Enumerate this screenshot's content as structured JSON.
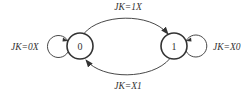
{
  "diagram": {
    "type": "state-diagram",
    "states": [
      {
        "id": "0",
        "label": "0"
      },
      {
        "id": "1",
        "label": "1"
      }
    ],
    "transitions": [
      {
        "from": "0",
        "to": "0",
        "label": "JK=0X"
      },
      {
        "from": "0",
        "to": "1",
        "label": "JK=1X"
      },
      {
        "from": "1",
        "to": "1",
        "label": "JK=X0"
      },
      {
        "from": "1",
        "to": "0",
        "label": "JK=X1"
      }
    ],
    "colors": {
      "stroke": "#333333",
      "background": "#ffffff"
    }
  }
}
